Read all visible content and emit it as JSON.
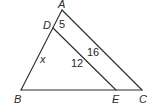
{
  "diagram": {
    "type": "triangle-with-parallel-segment",
    "points": {
      "A": {
        "label": "A",
        "x": 62,
        "y": 10
      },
      "B": {
        "label": "B",
        "x": 21,
        "y": 90
      },
      "C": {
        "label": "C",
        "x": 142,
        "y": 90
      },
      "D": {
        "label": "D",
        "x": 53,
        "y": 28
      },
      "E": {
        "label": "E",
        "x": 116,
        "y": 90
      }
    },
    "segments": [
      {
        "from": "A",
        "to": "B"
      },
      {
        "from": "A",
        "to": "C"
      },
      {
        "from": "B",
        "to": "C"
      },
      {
        "from": "D",
        "to": "E"
      }
    ],
    "measures": {
      "AD": "5",
      "AC": "16",
      "DB": "x",
      "DE": "12"
    },
    "line_color": "#2a2a2a"
  }
}
